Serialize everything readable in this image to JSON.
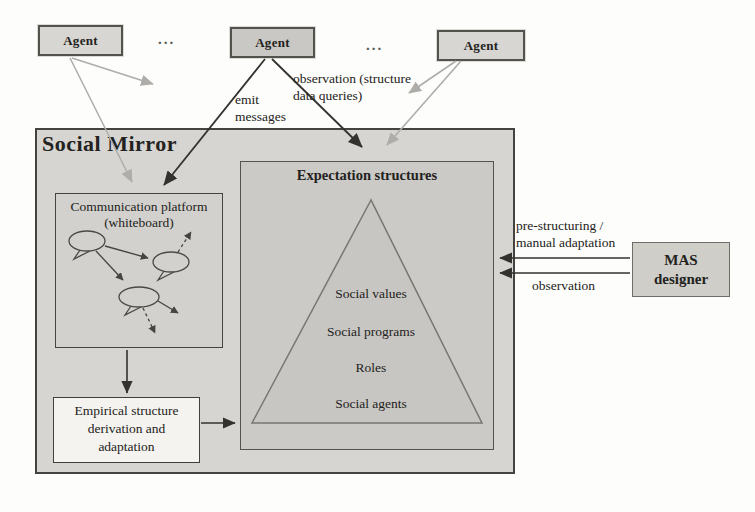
{
  "colors": {
    "page-bg": "#fdfdfb",
    "ink": "#232220",
    "mirror-fill": "#d6d5d1",
    "expectation-fill": "#cbcac6",
    "triangle-fill": "#c7c6c2",
    "comm-fill": "#d2d1cd",
    "empirical-fill": "#f4f3ef",
    "mas-fill": "#cfcec9",
    "agent-fill": "#d7d6d2",
    "agent-mid-fill": "#c9c8c4",
    "box-border": "#44433f",
    "arrow-dark": "#33322e",
    "arrow-gray": "#aeada9"
  },
  "agents": {
    "left": {
      "label": "Agent"
    },
    "middle": {
      "label": "Agent"
    },
    "right": {
      "label": "Agent"
    },
    "separator": "..."
  },
  "social_mirror": {
    "title": "Social Mirror"
  },
  "communication_platform": {
    "title_line1": "Communication platform",
    "title_line2": "(whiteboard)"
  },
  "expectation_structures": {
    "title": "Expectation structures",
    "levels": [
      "Social values",
      "Social programs",
      "Roles",
      "Social agents"
    ]
  },
  "empirical_box": {
    "line1": "Empirical structure",
    "line2": "derivation and",
    "line3": "adaptation"
  },
  "mas_designer": {
    "line1": "MAS",
    "line2": "designer"
  },
  "edge_labels": {
    "emit_line1": "emit",
    "emit_line2": "messages",
    "agent_observation_line1": "observation (structure",
    "agent_observation_line2": "data queries)",
    "prestructuring_line1": "pre-structuring /",
    "prestructuring_line2": "manual adaptation",
    "designer_observation": "observation"
  }
}
